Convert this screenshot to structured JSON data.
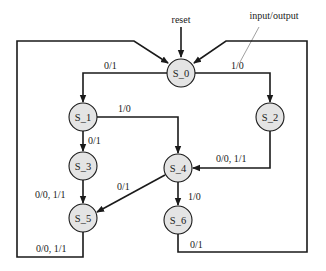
{
  "diagram": {
    "type": "finite-state-machine",
    "annotations": {
      "reset": "reset",
      "legend": "input/output"
    },
    "states": [
      {
        "id": "S_0",
        "label": "S_0",
        "cx": 181,
        "cy": 73
      },
      {
        "id": "S_1",
        "label": "S_1",
        "cx": 83,
        "cy": 117
      },
      {
        "id": "S_2",
        "label": "S_2",
        "cx": 270,
        "cy": 117
      },
      {
        "id": "S_3",
        "label": "S_3",
        "cx": 83,
        "cy": 166
      },
      {
        "id": "S_4",
        "label": "S_4",
        "cx": 178,
        "cy": 168
      },
      {
        "id": "S_5",
        "label": "S_5",
        "cx": 83,
        "cy": 218
      },
      {
        "id": "S_6",
        "label": "S_6",
        "cx": 178,
        "cy": 220
      }
    ],
    "transitions": [
      {
        "from": "S_0",
        "to": "S_1",
        "label": "0/1"
      },
      {
        "from": "S_0",
        "to": "S_2",
        "label": "1/0"
      },
      {
        "from": "S_1",
        "to": "S_4",
        "label": "1/0"
      },
      {
        "from": "S_1",
        "to": "S_3",
        "label": "0/1"
      },
      {
        "from": "S_2",
        "to": "S_4",
        "label": "0/0, 1/1"
      },
      {
        "from": "S_3",
        "to": "S_5",
        "label": "0/0, 1/1"
      },
      {
        "from": "S_4",
        "to": "S_5",
        "label": "0/1"
      },
      {
        "from": "S_4",
        "to": "S_6",
        "label": "1/0"
      },
      {
        "from": "S_5",
        "to": "S_0",
        "label": "0/0, 1/1"
      },
      {
        "from": "S_6",
        "to": "S_0",
        "label": "0/1"
      }
    ],
    "colors": {
      "node_fill": "#e4e4e4",
      "stroke": "#1a1a1a"
    }
  }
}
